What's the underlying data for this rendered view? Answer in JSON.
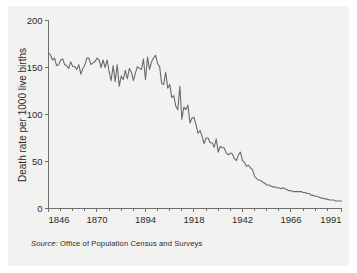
{
  "source": {
    "keyword": "Source:",
    "text": "Office of Population Census and Surveys"
  },
  "chart_data": {
    "type": "line",
    "title": "",
    "subtitle": "",
    "xlabel": "",
    "ylabel": "Death rate per 1000 live births",
    "xlim": [
      1846,
      1991
    ],
    "ylim": [
      0,
      200
    ],
    "grid": false,
    "legend": false,
    "xticks": [
      1846,
      1870,
      1894,
      1918,
      1942,
      1966,
      1991
    ],
    "xticklabels": [
      "1846",
      "1870",
      "1894",
      "1918",
      "1942",
      "1966",
      "1991"
    ],
    "yticks": [
      0,
      50,
      100,
      150,
      200
    ],
    "yticklabels": [
      "0",
      "50",
      "100",
      "150",
      "200"
    ],
    "minor_xticks": [
      1852,
      1858,
      1864,
      1876,
      1882,
      1888,
      1900,
      1906,
      1912,
      1924,
      1930,
      1936,
      1948,
      1954,
      1960,
      1972,
      1978,
      1984
    ],
    "line_color": "#6a6a6a",
    "series": [
      {
        "name": "Infant death rate",
        "x": [
          1846,
          1847,
          1848,
          1849,
          1850,
          1851,
          1852,
          1853,
          1854,
          1855,
          1856,
          1857,
          1858,
          1859,
          1860,
          1861,
          1862,
          1863,
          1864,
          1865,
          1866,
          1867,
          1868,
          1869,
          1870,
          1871,
          1872,
          1873,
          1874,
          1875,
          1876,
          1877,
          1878,
          1879,
          1880,
          1881,
          1882,
          1883,
          1884,
          1885,
          1886,
          1887,
          1888,
          1889,
          1890,
          1891,
          1892,
          1893,
          1894,
          1895,
          1896,
          1897,
          1898,
          1899,
          1900,
          1901,
          1902,
          1903,
          1904,
          1905,
          1906,
          1907,
          1908,
          1909,
          1910,
          1911,
          1912,
          1913,
          1914,
          1915,
          1916,
          1917,
          1918,
          1919,
          1920,
          1921,
          1922,
          1923,
          1924,
          1925,
          1926,
          1927,
          1928,
          1929,
          1930,
          1931,
          1932,
          1933,
          1934,
          1935,
          1936,
          1937,
          1938,
          1939,
          1940,
          1941,
          1942,
          1943,
          1944,
          1945,
          1946,
          1947,
          1948,
          1949,
          1950,
          1951,
          1952,
          1953,
          1954,
          1955,
          1956,
          1957,
          1958,
          1959,
          1960,
          1961,
          1962,
          1963,
          1964,
          1965,
          1966,
          1967,
          1968,
          1969,
          1970,
          1971,
          1972,
          1973,
          1974,
          1975,
          1976,
          1977,
          1978,
          1979,
          1980,
          1981,
          1982,
          1983,
          1984,
          1985,
          1986,
          1987,
          1988,
          1989,
          1990,
          1991
        ],
        "values": [
          166,
          163,
          158,
          160,
          152,
          153,
          158,
          159,
          153,
          152,
          149,
          156,
          151,
          151,
          148,
          153,
          143,
          149,
          153,
          160,
          160,
          153,
          155,
          156,
          160,
          158,
          150,
          158,
          150,
          158,
          146,
          136,
          152,
          135,
          153,
          130,
          141,
          137,
          147,
          138,
          149,
          145,
          136,
          144,
          151,
          149,
          148,
          159,
          137,
          161,
          148,
          156,
          160,
          163,
          154,
          151,
          133,
          132,
          145,
          128,
          132,
          118,
          120,
          109,
          105,
          130,
          95,
          108,
          105,
          110,
          91,
          96,
          97,
          89,
          80,
          83,
          77,
          69,
          75,
          75,
          70,
          70,
          65,
          74,
          60,
          66,
          65,
          64,
          59,
          57,
          59,
          58,
          53,
          51,
          57,
          60,
          51,
          49,
          45,
          46,
          43,
          41,
          34,
          32,
          30,
          30,
          28,
          27,
          25,
          25,
          24,
          23,
          23,
          22,
          22,
          21,
          22,
          21,
          20,
          19,
          19,
          18,
          18,
          18,
          18,
          18,
          17,
          17,
          16,
          16,
          14,
          14,
          13,
          13,
          12,
          11,
          11,
          10,
          10,
          9,
          9,
          9,
          8,
          8,
          8,
          8
        ]
      }
    ]
  }
}
